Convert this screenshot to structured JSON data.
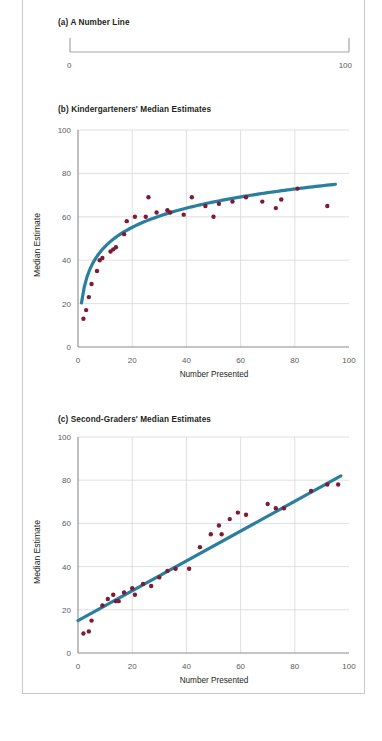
{
  "figure": {
    "background_color": "#ffffff",
    "frame_color": "#c9c9c9",
    "accent_line_color": "#2a7f9e",
    "point_color": "#7d1a35",
    "grid_color": "#d8d8d8",
    "axis_color": "#8a8a8a",
    "text_color": "#231f20",
    "tick_text_color": "#58595b"
  },
  "panel_a": {
    "title": "(a) A Number Line",
    "left_label": "0",
    "right_label": "100",
    "line_color": "#a6a6a6"
  },
  "chart_data": [
    {
      "id": "panel-a",
      "type": "line",
      "title": "(a) A Number Line",
      "xlabel": "",
      "ylabel": "",
      "xlim": [
        0,
        100
      ],
      "tick_labels": [
        "0",
        "100"
      ],
      "grid": false,
      "note": "Blank number line with endpoint ticks labeled 0 and 100"
    },
    {
      "id": "panel-b",
      "type": "scatter",
      "title": "(b) Kindergarteners' Median Estimates",
      "xlabel": "Number Presented",
      "ylabel": "Median Estimate",
      "xlim": [
        0,
        100
      ],
      "ylim": [
        0,
        100
      ],
      "xticks": [
        0,
        20,
        40,
        60,
        80,
        100
      ],
      "yticks": [
        0,
        20,
        40,
        60,
        80,
        100
      ],
      "grid": true,
      "legend": "none",
      "series": [
        {
          "name": "Median Estimate",
          "marker": "filled-circle",
          "color": "#7d1a35",
          "points": [
            {
              "x": 2,
              "y": 13
            },
            {
              "x": 3,
              "y": 17
            },
            {
              "x": 4,
              "y": 23
            },
            {
              "x": 5,
              "y": 29
            },
            {
              "x": 7,
              "y": 35
            },
            {
              "x": 8,
              "y": 40
            },
            {
              "x": 9,
              "y": 41
            },
            {
              "x": 12,
              "y": 44
            },
            {
              "x": 13,
              "y": 45
            },
            {
              "x": 14,
              "y": 46
            },
            {
              "x": 17,
              "y": 52
            },
            {
              "x": 18,
              "y": 58
            },
            {
              "x": 21,
              "y": 60
            },
            {
              "x": 25,
              "y": 60
            },
            {
              "x": 26,
              "y": 69
            },
            {
              "x": 29,
              "y": 62
            },
            {
              "x": 33,
              "y": 63
            },
            {
              "x": 34,
              "y": 62
            },
            {
              "x": 39,
              "y": 61
            },
            {
              "x": 42,
              "y": 69
            },
            {
              "x": 47,
              "y": 65
            },
            {
              "x": 50,
              "y": 60
            },
            {
              "x": 52,
              "y": 66
            },
            {
              "x": 57,
              "y": 67
            },
            {
              "x": 62,
              "y": 69
            },
            {
              "x": 68,
              "y": 67
            },
            {
              "x": 73,
              "y": 64
            },
            {
              "x": 75,
              "y": 68
            },
            {
              "x": 81,
              "y": 73
            },
            {
              "x": 92,
              "y": 65
            }
          ]
        }
      ],
      "fit": {
        "kind": "logarithmic",
        "color": "#2a7f9e",
        "description": "Logarithmic best-fit curve rising steeply then flattening near 75"
      }
    },
    {
      "id": "panel-c",
      "type": "scatter",
      "title": "(c) Second-Graders' Median Estimates",
      "xlabel": "Number Presented",
      "ylabel": "Median Estimate",
      "xlim": [
        0,
        100
      ],
      "ylim": [
        0,
        100
      ],
      "xticks": [
        0,
        20,
        40,
        60,
        80,
        100
      ],
      "yticks": [
        0,
        20,
        40,
        60,
        80,
        100
      ],
      "grid": true,
      "legend": "none",
      "series": [
        {
          "name": "Median Estimate",
          "marker": "filled-circle",
          "color": "#7d1a35",
          "points": [
            {
              "x": 2,
              "y": 9
            },
            {
              "x": 4,
              "y": 10
            },
            {
              "x": 5,
              "y": 15
            },
            {
              "x": 9,
              "y": 22
            },
            {
              "x": 11,
              "y": 25
            },
            {
              "x": 13,
              "y": 27
            },
            {
              "x": 14,
              "y": 24
            },
            {
              "x": 15,
              "y": 24
            },
            {
              "x": 17,
              "y": 28
            },
            {
              "x": 20,
              "y": 30
            },
            {
              "x": 21,
              "y": 27
            },
            {
              "x": 24,
              "y": 32
            },
            {
              "x": 27,
              "y": 31
            },
            {
              "x": 30,
              "y": 35
            },
            {
              "x": 33,
              "y": 38
            },
            {
              "x": 36,
              "y": 39
            },
            {
              "x": 41,
              "y": 39
            },
            {
              "x": 45,
              "y": 49
            },
            {
              "x": 49,
              "y": 55
            },
            {
              "x": 52,
              "y": 59
            },
            {
              "x": 53,
              "y": 55
            },
            {
              "x": 56,
              "y": 62
            },
            {
              "x": 59,
              "y": 65
            },
            {
              "x": 62,
              "y": 64
            },
            {
              "x": 70,
              "y": 69
            },
            {
              "x": 73,
              "y": 67
            },
            {
              "x": 76,
              "y": 67
            },
            {
              "x": 86,
              "y": 75
            },
            {
              "x": 92,
              "y": 78
            },
            {
              "x": 96,
              "y": 78
            }
          ]
        }
      ],
      "fit": {
        "kind": "linear",
        "color": "#2a7f9e",
        "description": "Straight best-fit line from about (0,15) to about (97,82)"
      }
    }
  ]
}
